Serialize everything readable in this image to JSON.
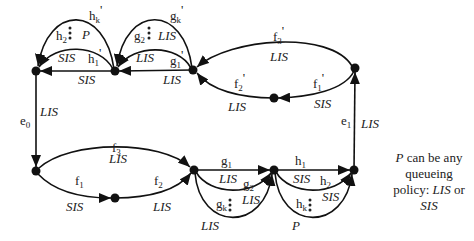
{
  "diagram": {
    "type": "directed-network",
    "nodes": [
      {
        "id": "T1",
        "x": 36,
        "y": 71
      },
      {
        "id": "T2",
        "x": 115,
        "y": 71
      },
      {
        "id": "T3",
        "x": 193,
        "y": 70
      },
      {
        "id": "TM",
        "x": 274,
        "y": 98
      },
      {
        "id": "TR",
        "x": 355,
        "y": 68
      },
      {
        "id": "B1",
        "x": 36,
        "y": 171
      },
      {
        "id": "BM",
        "x": 115,
        "y": 198
      },
      {
        "id": "B2",
        "x": 194,
        "y": 170
      },
      {
        "id": "B3",
        "x": 274,
        "y": 170
      },
      {
        "id": "B4",
        "x": 354,
        "y": 170
      }
    ],
    "edges": [
      {
        "name": "e0",
        "policy": "LIS",
        "from": "T1",
        "to": "B1"
      },
      {
        "name": "f1",
        "policy": "SIS",
        "from": "B1",
        "to": "BM"
      },
      {
        "name": "f2",
        "policy": "LIS",
        "from": "BM",
        "to": "B2"
      },
      {
        "name": "f3",
        "policy": "LIS",
        "from": "B1",
        "to": "B2"
      },
      {
        "name": "g1",
        "policy": "LIS",
        "from": "B2",
        "to": "B3"
      },
      {
        "name": "g2",
        "policy": "LIS",
        "from": "B2",
        "to": "B3"
      },
      {
        "name": "gk",
        "policy": "LIS",
        "from": "B2",
        "to": "B3"
      },
      {
        "name": "h1",
        "policy": "SIS",
        "from": "B3",
        "to": "B4"
      },
      {
        "name": "h2",
        "policy": "SIS",
        "from": "B3",
        "to": "B4"
      },
      {
        "name": "hk",
        "policy": "P",
        "from": "B3",
        "to": "B4"
      },
      {
        "name": "e1",
        "policy": "LIS",
        "from": "B4",
        "to": "TR"
      },
      {
        "name": "f1'",
        "policy": "SIS",
        "from": "TR",
        "to": "TM"
      },
      {
        "name": "f2'",
        "policy": "LIS",
        "from": "TM",
        "to": "T3"
      },
      {
        "name": "f3'",
        "policy": "LIS",
        "from": "TR",
        "to": "T3"
      },
      {
        "name": "g1'",
        "policy": "LIS",
        "from": "T3",
        "to": "T2"
      },
      {
        "name": "g2'",
        "policy": "LIS",
        "from": "T3",
        "to": "T2"
      },
      {
        "name": "gk'",
        "policy": "LIS",
        "from": "T3",
        "to": "T2"
      },
      {
        "name": "h1'",
        "policy": "SIS",
        "from": "T2",
        "to": "T1"
      },
      {
        "name": "h2'",
        "policy": "SIS",
        "from": "T2",
        "to": "T1"
      },
      {
        "name": "hk'",
        "policy": "P",
        "from": "T2",
        "to": "T1"
      }
    ],
    "labels": {
      "e0": {
        "base": "e",
        "sub": "0",
        "prime": ""
      },
      "e1": {
        "base": "e",
        "sub": "1",
        "prime": ""
      },
      "f1": {
        "base": "f",
        "sub": "1",
        "prime": ""
      },
      "f2": {
        "base": "f",
        "sub": "2",
        "prime": ""
      },
      "f3": {
        "base": "f",
        "sub": "3",
        "prime": ""
      },
      "g1": {
        "base": "g",
        "sub": "1",
        "prime": ""
      },
      "g2": {
        "base": "g",
        "sub": "2",
        "prime": ""
      },
      "gk": {
        "base": "g",
        "sub": "k",
        "prime": ""
      },
      "h1": {
        "base": "h",
        "sub": "1",
        "prime": ""
      },
      "h2": {
        "base": "h",
        "sub": "2",
        "prime": ""
      },
      "hk": {
        "base": "h",
        "sub": "k",
        "prime": ""
      },
      "f1p": {
        "base": "f",
        "sub": "1",
        "prime": "'"
      },
      "f2p": {
        "base": "f",
        "sub": "2",
        "prime": "'"
      },
      "f3p": {
        "base": "f",
        "sub": "3",
        "prime": "'"
      },
      "g1p": {
        "base": "g",
        "sub": "1",
        "prime": "'"
      },
      "g2p": {
        "base": "g",
        "sub": "2",
        "prime": ""
      },
      "gkp": {
        "base": "g",
        "sub": "k",
        "prime": "'"
      },
      "h1p": {
        "base": "h",
        "sub": "1",
        "prime": "'"
      },
      "h2p": {
        "base": "h",
        "sub": "2",
        "prime": ""
      },
      "hkp": {
        "base": "h",
        "sub": "k",
        "prime": "'"
      }
    },
    "policies": {
      "lis": "LIS",
      "sis": "SIS",
      "p": "P"
    }
  },
  "note": {
    "p": "P",
    "line1_rest": " can be any",
    "line2": "queueing",
    "line3_pre": "policy: ",
    "line3_lis": "LIS",
    "line3_post": " or",
    "line4": "SIS"
  }
}
